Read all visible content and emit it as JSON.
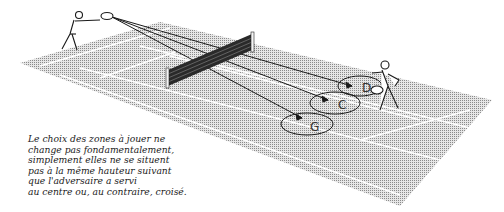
{
  "illustration": {
    "subject": "tennis serve return target zones",
    "zones": [
      {
        "label": "D"
      },
      {
        "label": "C"
      },
      {
        "label": "G"
      }
    ],
    "colors": {
      "court": "#bdbdbd",
      "lines": "#ffffff",
      "ink": "#1a1a1a",
      "background": "#ffffff"
    }
  },
  "caption": {
    "lines": [
      "Le choix des zones à jouer ne",
      "change pas fondamentalement,",
      "simplement elles ne se situent",
      "pas à la même hauteur suivant",
      "que l'adversaire a servi",
      "au centre ou, au contraire, croisé."
    ]
  }
}
